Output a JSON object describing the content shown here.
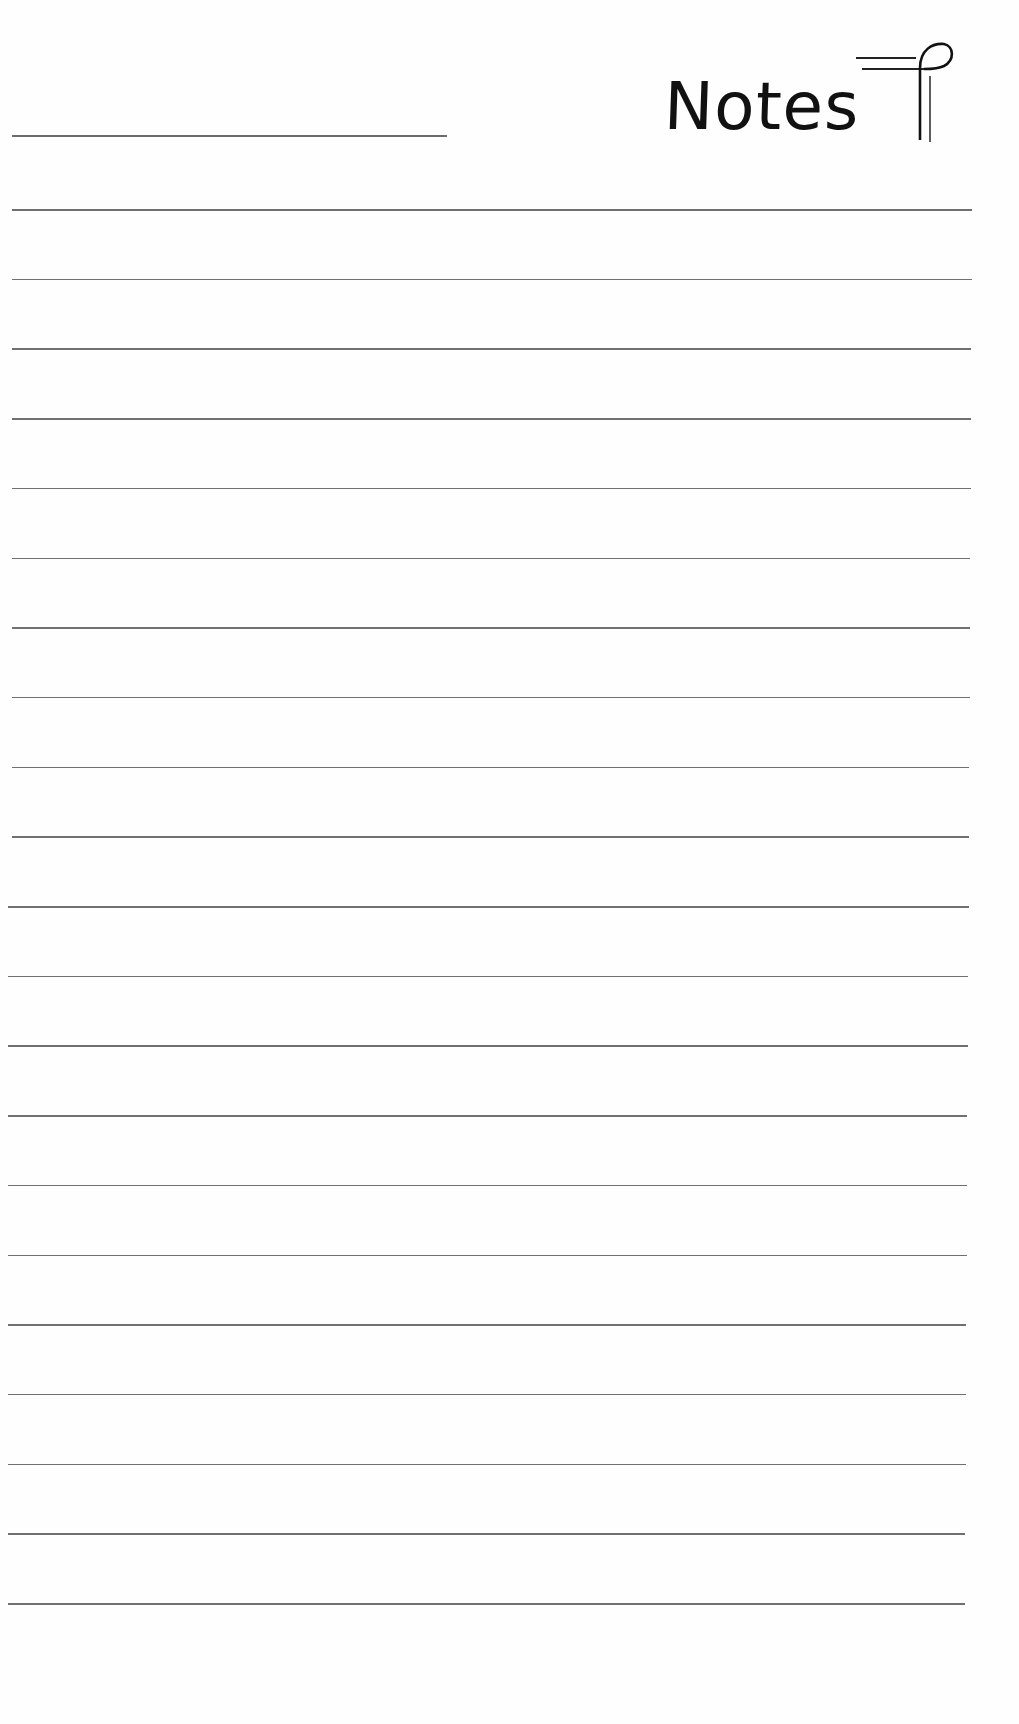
{
  "header": {
    "title": "Notes",
    "name_line_label": "",
    "ornament_icon": "pilcrow-icon"
  },
  "colors": {
    "paper": "#fefefe",
    "ink": "#111111",
    "rule": "#707070"
  },
  "ruled_lines": {
    "count": 21,
    "first_y": 209,
    "spacing": 69.7,
    "x_start": 8,
    "x_end": 972
  }
}
